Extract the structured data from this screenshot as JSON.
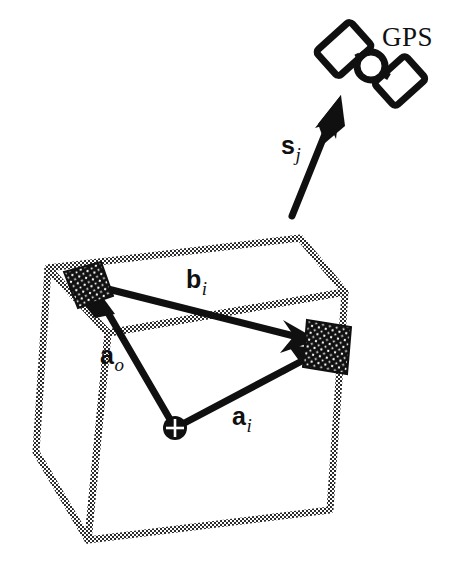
{
  "figure": {
    "background_color": "#ffffff",
    "ink_color": "#101010",
    "stipple_color": "#2b2b2b",
    "width": 460,
    "height": 588
  },
  "labels": {
    "gps": "GPS",
    "s_symbol": "s",
    "s_subscript": "j",
    "b_symbol": "b",
    "b_subscript": "i",
    "a_o_symbol": "a",
    "a_o_subscript": "o",
    "a_i_symbol": "a",
    "a_i_subscript": "i"
  },
  "elements": {
    "satellite_name": "gps-satellite-icon",
    "box_name": "wireframe-box",
    "origin_name": "origin-marker",
    "target_left_name": "target-marker-left",
    "target_right_name": "target-marker-right"
  },
  "geometry": {
    "origin_point": [
      175,
      428
    ],
    "target_left_point": [
      92,
      284
    ],
    "target_right_point": [
      318,
      348
    ],
    "satellite_point": [
      360,
      62
    ],
    "s_vector_tail": [
      292,
      216
    ],
    "s_vector_head": [
      340,
      96
    ]
  }
}
